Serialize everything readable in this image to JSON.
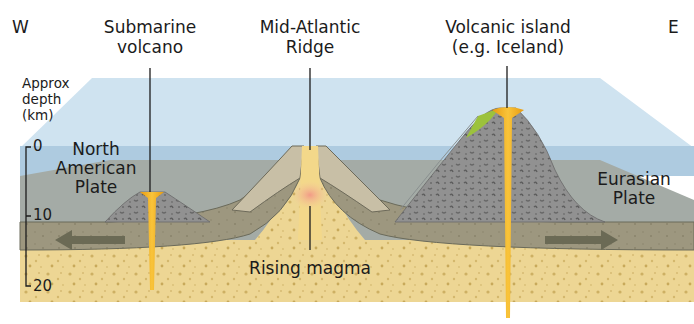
{
  "diagram": {
    "compass": {
      "west": "W",
      "east": "E"
    },
    "labels": {
      "submarine_volcano": [
        "Submarine",
        "volcano"
      ],
      "mid_atlantic_ridge": [
        "Mid-Atlantic",
        "Ridge"
      ],
      "volcanic_island": [
        "Volcanic island",
        "(e.g. Iceland)"
      ],
      "rising_magma": "Rising magma",
      "north_american_plate": [
        "North",
        "American",
        "Plate"
      ],
      "eurasian_plate": [
        "Eurasian",
        "Plate"
      ]
    },
    "depth_axis": {
      "title": [
        "Approx",
        "depth",
        "(km)"
      ],
      "ticks": [
        "0",
        "10",
        "20"
      ]
    },
    "arrows": {
      "left": "North American Plate moving west",
      "right": "Eurasian Plate moving east"
    },
    "colors": {
      "ocean_surface": "#cfe3f0",
      "ocean_deep": "#a9c8df",
      "seafloor_gray": "#a4aba6",
      "crust_plate": "#9e9880",
      "mantle": "#ecd592",
      "magma": "#f2b21c",
      "volcano_rock": "#8e8e8c",
      "ridge_light": "#c8bfa6",
      "ridge_hot": "#f0a08a",
      "lava_green": "#9cc23c",
      "arrow": "#6b6a55"
    }
  }
}
